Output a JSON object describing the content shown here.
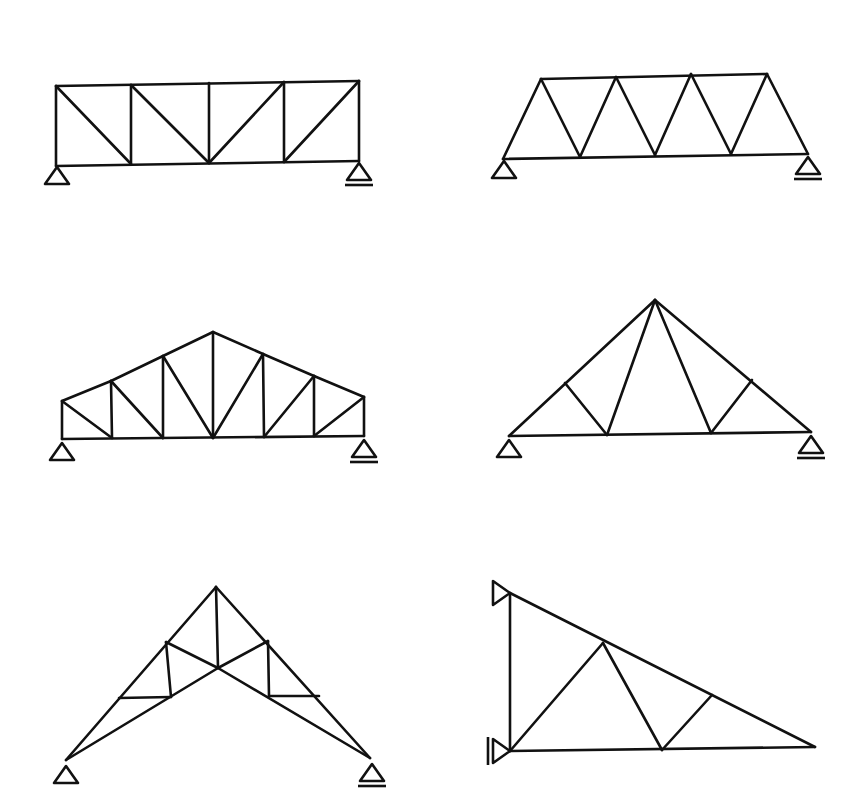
{
  "diagram": {
    "title": "",
    "stroke_color": "#111111",
    "background": "#ffffff",
    "trusses": [
      {
        "name": "pratt-flat-truss",
        "nodes": {
          "T0": [
            56,
            86
          ],
          "T1": [
            131,
            85
          ],
          "T2": [
            209,
            83
          ],
          "T3": [
            284,
            82
          ],
          "T4": [
            359,
            81
          ],
          "B0": [
            56,
            166
          ],
          "B1": [
            131,
            164
          ],
          "B2": [
            209,
            163
          ],
          "B3": [
            284,
            162
          ],
          "B4": [
            359,
            161
          ]
        },
        "members": [
          [
            "T0",
            "T4"
          ],
          [
            "B0",
            "B4"
          ],
          [
            "T0",
            "B0"
          ],
          [
            "T1",
            "B1"
          ],
          [
            "T2",
            "B2"
          ],
          [
            "T3",
            "B3"
          ],
          [
            "T4",
            "B4"
          ],
          [
            "T0",
            "B1"
          ],
          [
            "T1",
            "B2"
          ],
          [
            "T3",
            "B2"
          ],
          [
            "T4",
            "B3"
          ]
        ],
        "supports": [
          {
            "type": "pin",
            "x": 57,
            "y": 167
          },
          {
            "type": "roller",
            "x": 359,
            "y": 163
          }
        ]
      },
      {
        "name": "warren-truss",
        "nodes": {
          "T0": [
            541,
            79
          ],
          "T1": [
            616,
            77
          ],
          "T2": [
            691,
            74
          ],
          "T3": [
            767,
            74
          ],
          "B0": [
            503,
            159
          ],
          "B1": [
            580,
            157
          ],
          "B2": [
            655,
            155
          ],
          "B3": [
            731,
            154
          ],
          "B4": [
            808,
            154
          ]
        },
        "members": [
          [
            "T0",
            "T3"
          ],
          [
            "B0",
            "B4"
          ],
          [
            "B0",
            "T0"
          ],
          [
            "T0",
            "B1"
          ],
          [
            "B1",
            "T1"
          ],
          [
            "T1",
            "B2"
          ],
          [
            "B2",
            "T2"
          ],
          [
            "T2",
            "B3"
          ],
          [
            "B3",
            "T3"
          ],
          [
            "T3",
            "B4"
          ]
        ],
        "supports": [
          {
            "type": "pin",
            "x": 504,
            "y": 161
          },
          {
            "type": "roller",
            "x": 808,
            "y": 157
          }
        ]
      },
      {
        "name": "howe-pitched-truss",
        "nodes": {
          "T0": [
            62,
            401
          ],
          "T1": [
            111,
            381
          ],
          "T2": [
            163,
            356
          ],
          "T3": [
            213,
            332
          ],
          "T4": [
            263,
            354
          ],
          "T5": [
            314,
            376
          ],
          "T6": [
            364,
            397
          ],
          "B0": [
            62,
            439
          ],
          "B1": [
            112,
            438
          ],
          "B2": [
            163,
            438
          ],
          "B3": [
            213,
            438
          ],
          "B4": [
            264,
            437
          ],
          "B5": [
            314,
            436
          ],
          "B6": [
            364,
            436
          ]
        },
        "members": [
          [
            "T0",
            "T1"
          ],
          [
            "T1",
            "T2"
          ],
          [
            "T2",
            "T3"
          ],
          [
            "T3",
            "T4"
          ],
          [
            "T4",
            "T5"
          ],
          [
            "T5",
            "T6"
          ],
          [
            "B0",
            "B6"
          ],
          [
            "T0",
            "B0"
          ],
          [
            "T1",
            "B1"
          ],
          [
            "T2",
            "B2"
          ],
          [
            "T3",
            "B3"
          ],
          [
            "T4",
            "B4"
          ],
          [
            "T5",
            "B5"
          ],
          [
            "T6",
            "B6"
          ],
          [
            "T0",
            "B1"
          ],
          [
            "T1",
            "B2"
          ],
          [
            "T2",
            "B3"
          ],
          [
            "T4",
            "B3"
          ],
          [
            "T5",
            "B4"
          ],
          [
            "T6",
            "B5"
          ]
        ],
        "supports": [
          {
            "type": "pin",
            "x": 62,
            "y": 443
          },
          {
            "type": "roller",
            "x": 364,
            "y": 440
          }
        ]
      },
      {
        "name": "fink-triangular-truss",
        "nodes": {
          "A": [
            509,
            436
          ],
          "P": [
            655,
            300
          ],
          "E": [
            811,
            432
          ],
          "L1": [
            565,
            383
          ],
          "R1": [
            752,
            380
          ],
          "B1": [
            607,
            435
          ],
          "B2": [
            711,
            433
          ]
        },
        "members": [
          [
            "A",
            "P"
          ],
          [
            "P",
            "E"
          ],
          [
            "A",
            "E"
          ],
          [
            "L1",
            "B1"
          ],
          [
            "B1",
            "P"
          ],
          [
            "P",
            "B2"
          ],
          [
            "B2",
            "R1"
          ]
        ],
        "supports": [
          {
            "type": "pin",
            "x": 509,
            "y": 440
          },
          {
            "type": "roller",
            "x": 811,
            "y": 436
          }
        ]
      },
      {
        "name": "scissors-truss",
        "nodes": {
          "L": [
            66,
            760
          ],
          "A": [
            216,
            587
          ],
          "R": [
            370,
            758
          ],
          "UL": [
            166,
            642
          ],
          "UR": [
            268,
            641
          ],
          "C": [
            218,
            668
          ],
          "HL": [
            119,
            698
          ],
          "HR": [
            319,
            696
          ],
          "LL": [
            171,
            697
          ],
          "LR": [
            269,
            696
          ]
        },
        "members": [
          [
            "L",
            "A"
          ],
          [
            "A",
            "R"
          ],
          [
            "L",
            "C"
          ],
          [
            "C",
            "R"
          ],
          [
            "A",
            "C"
          ],
          [
            "UL",
            "C"
          ],
          [
            "C",
            "UR"
          ],
          [
            "UL",
            "LL"
          ],
          [
            "UR",
            "LR"
          ],
          [
            "HL",
            "LL"
          ],
          [
            "LR",
            "HR"
          ]
        ],
        "supports": [
          {
            "type": "pin",
            "x": 66,
            "y": 766
          },
          {
            "type": "roller",
            "x": 372,
            "y": 764
          }
        ]
      },
      {
        "name": "cantilever-wall-truss",
        "nodes": {
          "TW": [
            510,
            593
          ],
          "BW": [
            510,
            751
          ],
          "TIP": [
            815,
            747
          ],
          "M": [
            603,
            643
          ],
          "BM": [
            662,
            750
          ],
          "N": [
            712,
            695
          ]
        },
        "members": [
          [
            "TW",
            "BW"
          ],
          [
            "TW",
            "TIP"
          ],
          [
            "BW",
            "TIP"
          ],
          [
            "BW",
            "M"
          ],
          [
            "M",
            "BM"
          ],
          [
            "BM",
            "N"
          ]
        ],
        "supports": [
          {
            "type": "wall-pin",
            "x": 510,
            "y": 593
          },
          {
            "type": "wall-roller",
            "x": 510,
            "y": 751
          }
        ]
      }
    ]
  }
}
